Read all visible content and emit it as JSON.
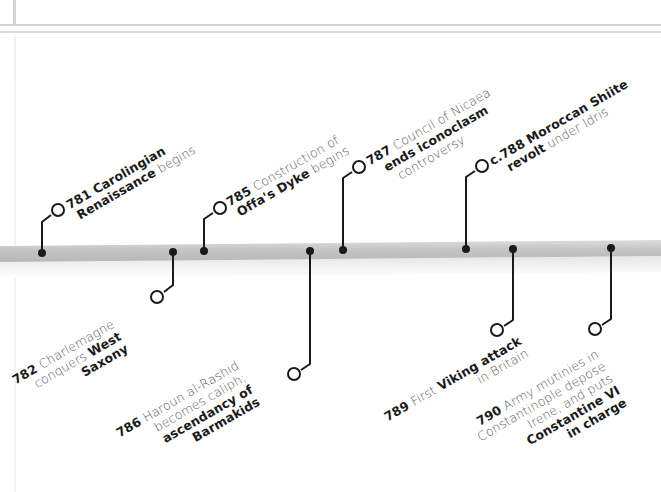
{
  "timeline": {
    "bar_color": "#c8c8c8",
    "line_color": "#1a1a1a",
    "events": [
      {
        "id": "781",
        "side": "above",
        "lines": [
          {
            "year": "781",
            "bold": "Carolingian",
            "text": ""
          },
          {
            "bold": "Renaissance",
            "text": " begins"
          }
        ]
      },
      {
        "id": "782",
        "side": "below",
        "lines": [
          {
            "year": "782",
            "text": " Charlemagne"
          },
          {
            "text": "conquers ",
            "bold": "West"
          },
          {
            "bold": "Saxony"
          }
        ]
      },
      {
        "id": "785",
        "side": "above",
        "lines": [
          {
            "year": "785",
            "text": " Construction of"
          },
          {
            "bold": "Offa's Dyke",
            "text": " begins"
          }
        ]
      },
      {
        "id": "786",
        "side": "below",
        "lines": [
          {
            "year": "786",
            "text": " Haroun al-Rashid"
          },
          {
            "text": "becomes caliph;"
          },
          {
            "bold": "ascendancy of"
          },
          {
            "bold": "Barmakids"
          }
        ]
      },
      {
        "id": "787",
        "side": "above",
        "lines": [
          {
            "year": "787",
            "text": " Council of Nicaea"
          },
          {
            "bold": "ends iconoclasm"
          },
          {
            "text": "controversy"
          }
        ]
      },
      {
        "id": "788",
        "side": "above",
        "lines": [
          {
            "year": "c.788",
            "bold": " Moroccan Shiite"
          },
          {
            "bold": "revolt",
            "text": " under Idris"
          }
        ]
      },
      {
        "id": "789",
        "side": "below",
        "lines": [
          {
            "year": "789",
            "text": " First ",
            "bold": "Viking attack"
          },
          {
            "text": "in Britain"
          }
        ]
      },
      {
        "id": "790",
        "side": "below",
        "lines": [
          {
            "year": "790",
            "text": " Army mutinies in"
          },
          {
            "text": "Constantinople depose"
          },
          {
            "text": "Irene, and puts"
          },
          {
            "bold": "Constantine VI"
          },
          {
            "bold": "in charge"
          }
        ]
      }
    ]
  },
  "labels": {
    "e781": {
      "year": "781",
      "l1b": "Carolingian",
      "l2b": "Renaissance",
      "l2": "begins"
    },
    "e782": {
      "year": "782",
      "l1": "Charlemagne",
      "l2": "conquers",
      "l2b": "West",
      "l3b": "Saxony"
    },
    "e785": {
      "year": "785",
      "l1": "Construction of",
      "l2b": "Offa's Dyke",
      "l2": "begins"
    },
    "e786": {
      "year": "786",
      "l1": "Haroun al-Rashid",
      "l2": "becomes caliph;",
      "l3b": "ascendancy of",
      "l4b": "Barmakids"
    },
    "e787": {
      "year": "787",
      "l1": "Council of Nicaea",
      "l2b": "ends iconoclasm",
      "l3": "controversy"
    },
    "e788": {
      "year": "c.788",
      "l1b": "Moroccan Shiite",
      "l2b": "revolt",
      "l2": "under Idris"
    },
    "e789": {
      "year": "789",
      "l1": "First",
      "l1b": "Viking attack",
      "l2": "in Britain"
    },
    "e790": {
      "year": "790",
      "l1": "Army mutinies in",
      "l2": "Constantinople depose",
      "l3": "Irene, and puts",
      "l4b": "Constantine VI",
      "l5b": "in charge"
    }
  }
}
